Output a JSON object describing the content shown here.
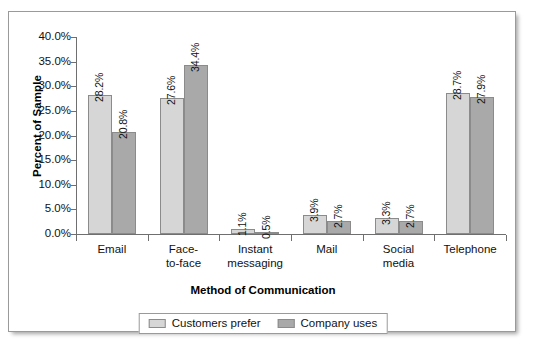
{
  "chart_data": {
    "type": "bar",
    "title": "",
    "xlabel": "Method of Communication",
    "ylabel": "Percent of Sample",
    "categories": [
      "Email",
      "Face-to-face",
      "Instant messaging",
      "Mail",
      "Social media",
      "Telephone"
    ],
    "category_lines": [
      [
        "Email"
      ],
      [
        "Face-",
        "to-face"
      ],
      [
        "Instant",
        "messaging"
      ],
      [
        "Mail"
      ],
      [
        "Social",
        "media"
      ],
      [
        "Telephone"
      ]
    ],
    "series": [
      {
        "name": "Customers prefer",
        "color": "#d6d6d6",
        "values": [
          28.2,
          27.6,
          1.1,
          3.9,
          3.3,
          28.7
        ],
        "labels": [
          "28.2%",
          "27.6%",
          "1.1%",
          "3.9%",
          "3.3%",
          "28.7%"
        ]
      },
      {
        "name": "Company uses",
        "color": "#a9a9a9",
        "values": [
          20.8,
          34.4,
          0.5,
          2.7,
          2.7,
          27.9
        ],
        "labels": [
          "20.8%",
          "34.4%",
          "0.5%",
          "2.7%",
          "2.7%",
          "27.9%"
        ]
      }
    ],
    "ylim": [
      0,
      40
    ],
    "ytick_values": [
      0,
      5,
      10,
      15,
      20,
      25,
      30,
      35,
      40
    ],
    "ytick_labels": [
      "0.0%",
      "5.0%",
      "10.0%",
      "15.0%",
      "20.0%",
      "25.0%",
      "30.0%",
      "35.0%",
      "40.0%"
    ],
    "grid": false,
    "legend_position": "bottom",
    "legend_entries": [
      "Customers prefer",
      "Company uses"
    ]
  }
}
